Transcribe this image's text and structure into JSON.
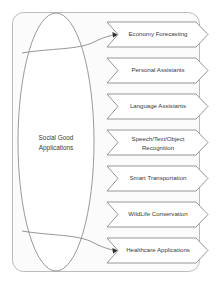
{
  "diagram": {
    "type": "flowchart",
    "source_node": {
      "shape": "ellipse",
      "label_line1": "Social Good",
      "label_line2": "Applications"
    },
    "targets": [
      {
        "shape": "chevron",
        "label_line1": "Economy Forecasting",
        "label_line2": ""
      },
      {
        "shape": "chevron",
        "label_line1": "Personal Assistants",
        "label_line2": ""
      },
      {
        "shape": "chevron",
        "label_line1": "Language Assistants",
        "label_line2": ""
      },
      {
        "shape": "chevron",
        "label_line1": "Speech/Text/Object",
        "label_line2": "Recognition"
      },
      {
        "shape": "chevron",
        "label_line1": "Smart Transportation",
        "label_line2": ""
      },
      {
        "shape": "chevron",
        "label_line1": "WildLife Conservation",
        "label_line2": ""
      },
      {
        "shape": "chevron",
        "label_line1": "Healthcare Applications",
        "label_line2": ""
      }
    ],
    "connectors": [
      {
        "from": "source_node",
        "to": "targets.0",
        "style": "curved-arrow"
      },
      {
        "from": "source_node",
        "to": "targets.6",
        "style": "curved-arrow"
      }
    ],
    "colors": {
      "shape_fill": "#ffffff",
      "shape_stroke": "#8a8a8a",
      "frame_fill": "#fbfbfb",
      "frame_stroke": "#b4b4b4",
      "text": "#3a3a3a",
      "arrow_head": "#2e2e2e",
      "background": "#ffffff"
    }
  }
}
